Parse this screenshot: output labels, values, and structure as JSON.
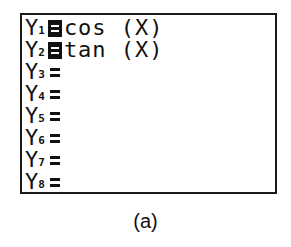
{
  "screen": {
    "title": "Y= editor",
    "functions": [
      {
        "name": "Y",
        "sub": "1",
        "selected": true,
        "expression": "cos (X)"
      },
      {
        "name": "Y",
        "sub": "2",
        "selected": true,
        "expression": "tan (X)"
      },
      {
        "name": "Y",
        "sub": "3",
        "selected": false,
        "expression": ""
      },
      {
        "name": "Y",
        "sub": "4",
        "selected": false,
        "expression": ""
      },
      {
        "name": "Y",
        "sub": "5",
        "selected": false,
        "expression": ""
      },
      {
        "name": "Y",
        "sub": "6",
        "selected": false,
        "expression": ""
      },
      {
        "name": "Y",
        "sub": "7",
        "selected": false,
        "expression": ""
      },
      {
        "name": "Y",
        "sub": "8",
        "selected": false,
        "expression": ""
      }
    ]
  },
  "caption": "(a)",
  "colors": {
    "foreground": "#111111",
    "background": "#ffffff"
  }
}
